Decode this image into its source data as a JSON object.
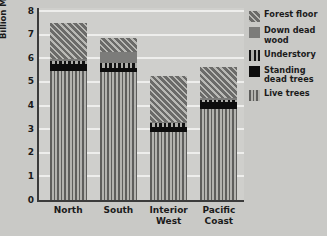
{
  "chart_data": {
    "type": "bar",
    "stacked": true,
    "title": "",
    "xlabel": "",
    "ylabel": "Billion Metric Tons",
    "ylim": [
      0,
      8
    ],
    "ytick_labels": [
      "8",
      "7",
      "6",
      "5",
      "4",
      "3",
      "2",
      "1",
      "0"
    ],
    "ytick_values": [
      8,
      7,
      6,
      5,
      4,
      3,
      2,
      1,
      0
    ],
    "grid": true,
    "legend_position": "right",
    "categories": [
      "North",
      "South",
      "Interior West",
      "Pacific Coast"
    ],
    "category_labels": [
      "North",
      "South",
      "Interior\nWest",
      "Pacific\nCoast"
    ],
    "series": [
      {
        "name": "Live trees",
        "pattern": "vertical-stripes",
        "values": [
          5.45,
          5.4,
          2.9,
          3.85
        ]
      },
      {
        "name": "Standing dead trees",
        "pattern": "solid-black",
        "values": [
          0.3,
          0.2,
          0.2,
          0.3
        ]
      },
      {
        "name": "Understory",
        "pattern": "thick-vertical-bars",
        "values": [
          0.15,
          0.2,
          0.15,
          0.1
        ]
      },
      {
        "name": "Down dead wood",
        "pattern": "solid-gray",
        "values": [
          0.05,
          0.45,
          0.05,
          0.05
        ]
      },
      {
        "name": "Forest floor",
        "pattern": "diagonal-hatch",
        "values": [
          1.55,
          0.6,
          1.95,
          1.35
        ]
      }
    ],
    "totals": [
      7.5,
      6.85,
      5.25,
      5.65
    ]
  },
  "legend": {
    "entries": [
      {
        "label": "Forest floor",
        "series": "Forest floor"
      },
      {
        "label": "Down dead\nwood",
        "series": "Down dead wood"
      },
      {
        "label": "Understory",
        "series": "Understory"
      },
      {
        "label": "Standing\ndead trees",
        "series": "Standing dead trees"
      },
      {
        "label": "Live trees",
        "series": "Live trees"
      }
    ]
  },
  "colors": {
    "background": "#c9c9c6",
    "plot_background": "#cfcfcc",
    "axis": "#3b3b3b",
    "gridline": "#eeeeec",
    "text": "#1b1b1b",
    "live_trees": "#8e8e8b",
    "standing_dead_trees": "#0d0d0d",
    "understory": "#7b7b79",
    "down_dead_wood": "#7c7c7a",
    "forest_floor": "#858582"
  }
}
